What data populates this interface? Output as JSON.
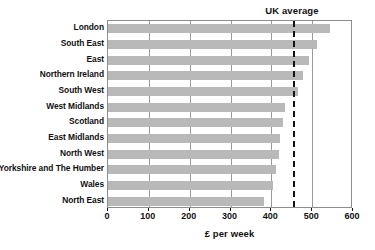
{
  "chart_data": {
    "type": "bar",
    "orientation": "horizontal",
    "title": "",
    "xlabel": "£ per week",
    "ylabel": "",
    "xlim": [
      0,
      600
    ],
    "xticks": [
      0,
      100,
      200,
      300,
      400,
      500,
      600
    ],
    "xticklabels": [
      "0",
      "100",
      "200",
      "300",
      "400",
      "500",
      "600"
    ],
    "grid": "vertical",
    "legend": "none",
    "categories": [
      "London",
      "South East",
      "East",
      "Northern Ireland",
      "South West",
      "West Midlands",
      "Scotland",
      "East Midlands",
      "North West",
      "Yorkshire and The Humber",
      "Wales",
      "North East"
    ],
    "values": [
      544,
      511,
      493,
      478,
      466,
      434,
      429,
      420,
      418,
      411,
      404,
      382
    ],
    "bar_color": "#b9b9b9",
    "annotations": [
      {
        "name": "uk-average",
        "label": "UK average",
        "value": 453,
        "style": "dashed-vertical-line",
        "color": "#111111"
      }
    ]
  },
  "axis": {
    "x_title": "£ per week",
    "tick_labels": [
      "0",
      "100",
      "200",
      "300",
      "400",
      "500",
      "600"
    ]
  },
  "category_labels": [
    "London",
    "South East",
    "East",
    "Northern Ireland",
    "South West",
    "West Midlands",
    "Scotland",
    "East Midlands",
    "North West",
    "Yorkshire and The Humber",
    "Wales",
    "North East"
  ],
  "annotation": {
    "uk_average_label": "UK average"
  }
}
